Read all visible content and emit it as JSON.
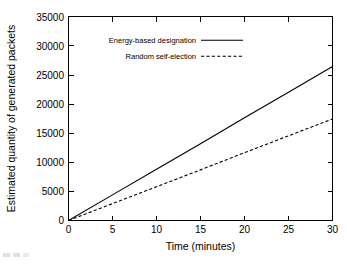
{
  "chart_data": {
    "type": "line",
    "title": "",
    "xlabel": "Time (minutes)",
    "ylabel": "Estimated quantity of generated packets",
    "xlim": [
      0,
      30
    ],
    "ylim": [
      0,
      35000
    ],
    "xticks": [
      "0",
      "5",
      "10",
      "15",
      "20",
      "25",
      "30"
    ],
    "yticks": [
      "0",
      "5000",
      "10000",
      "15000",
      "20000",
      "25000",
      "30000",
      "35000"
    ],
    "grid": false,
    "legend_position": "upper-left-inside",
    "x": [
      0,
      5,
      10,
      15,
      20,
      25,
      30
    ],
    "series": [
      {
        "name": "Energy-based designation",
        "style": "solid",
        "color": "#000000",
        "values": [
          0,
          4400,
          8800,
          13200,
          17650,
          22050,
          26450
        ]
      },
      {
        "name": "Random self-election",
        "style": "dashed",
        "color": "#000000",
        "values": [
          0,
          2900,
          5800,
          8700,
          11650,
          14550,
          17450
        ]
      }
    ],
    "legend": [
      {
        "label": "Energy-based designation",
        "style": "solid"
      },
      {
        "label": "Random self-election",
        "style": "dashed"
      }
    ]
  }
}
